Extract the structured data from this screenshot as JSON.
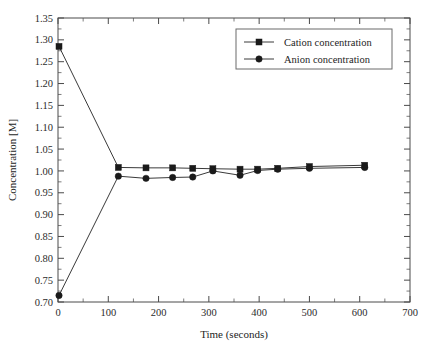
{
  "chart_data": {
    "type": "line",
    "title": "",
    "xlabel": "Time (seconds)",
    "ylabel": "Concentration [M]",
    "xlim": [
      0,
      700
    ],
    "ylim": [
      0.7,
      1.35
    ],
    "xticks": [
      0,
      100,
      200,
      300,
      400,
      500,
      600,
      700
    ],
    "xtick_labels": [
      "0",
      "100",
      "200",
      "300",
      "400",
      "500",
      "600",
      "700"
    ],
    "yticks": [
      0.7,
      0.75,
      0.8,
      0.85,
      0.9,
      0.95,
      1.0,
      1.05,
      1.1,
      1.15,
      1.2,
      1.25,
      1.3,
      1.35
    ],
    "ytick_labels": [
      "0.70",
      "0.75",
      "0.80",
      "0.85",
      "0.90",
      "0.95",
      "1.00",
      "1.05",
      "1.10",
      "1.15",
      "1.20",
      "1.25",
      "1.30",
      "1.35"
    ],
    "grid": false,
    "minor_ticks": true,
    "frame": "box",
    "legend_position": "upper right",
    "series": [
      {
        "name": "Cation concentration",
        "marker": "square",
        "color": "#1a1a1a",
        "x": [
          2,
          120,
          175,
          228,
          268,
          308,
          362,
          397,
          437,
          500,
          610
        ],
        "y": [
          1.285,
          1.008,
          1.007,
          1.007,
          1.006,
          1.005,
          1.004,
          1.004,
          1.006,
          1.01,
          1.013
        ]
      },
      {
        "name": "Anion concentration",
        "marker": "circle",
        "color": "#1a1a1a",
        "x": [
          2,
          120,
          175,
          228,
          268,
          308,
          362,
          397,
          437,
          500,
          610
        ],
        "y": [
          0.715,
          0.988,
          0.983,
          0.985,
          0.986,
          1.0,
          0.99,
          1.001,
          1.004,
          1.006,
          1.008
        ]
      }
    ],
    "legend": [
      {
        "label": "Cation concentration",
        "marker": "square"
      },
      {
        "label": "Anion concentration",
        "marker": "circle"
      }
    ]
  }
}
